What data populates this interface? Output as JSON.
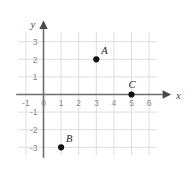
{
  "chart_data": {
    "type": "scatter",
    "title": "",
    "xlabel": "x",
    "ylabel": "y",
    "grid": true,
    "legend": "none",
    "xlim": [
      -1.6,
      6.6
    ],
    "ylim": [
      -3.6,
      3.6
    ],
    "xticks": [
      -1,
      0,
      1,
      2,
      3,
      4,
      5,
      6
    ],
    "yticks": [
      3,
      2,
      1,
      -1,
      -2,
      -3
    ],
    "xtick_labels": [
      "-1",
      "0",
      "1",
      "2",
      "3",
      "4",
      "5",
      "6"
    ],
    "ytick_labels": [
      "3",
      "2",
      "1",
      "-1",
      "-2",
      "-3"
    ],
    "points": [
      {
        "label": "A",
        "x": 3,
        "y": 2
      },
      {
        "label": "B",
        "x": 1,
        "y": -3
      },
      {
        "label": "C",
        "x": 5,
        "y": 0
      }
    ]
  },
  "axes": {
    "x_axis_label": "x",
    "y_axis_label": "y",
    "origin_label": "0"
  },
  "colors": {
    "background": "#ffffff",
    "grid": "#e0dcdc",
    "axis": "#6e6e6e",
    "tick_text": "#8a8a8a",
    "point_fill": "#111111",
    "point_label": "#1a1a1a",
    "axis_name": "#4a4a4a"
  }
}
